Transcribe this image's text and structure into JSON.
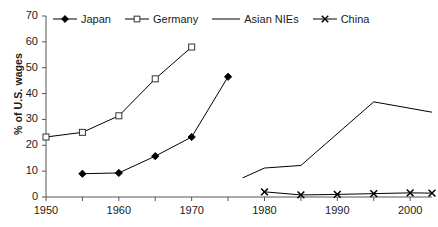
{
  "chart_data": {
    "type": "line",
    "title": "",
    "xlabel": "",
    "ylabel": "% of U.S. wages",
    "xlim": [
      1950,
      2003
    ],
    "ylim": [
      0,
      70
    ],
    "grid": false,
    "legend_position": "top",
    "xticks": [
      1950,
      1960,
      1970,
      1980,
      1990,
      2000
    ],
    "xtick_labels": [
      "1950",
      "1960",
      "1970",
      "1980",
      "1990",
      "2000"
    ],
    "xminor_ticks": [
      1955,
      1965,
      1975,
      1985,
      1995
    ],
    "yticks": [
      0,
      10,
      20,
      30,
      40,
      50,
      60,
      70
    ],
    "ytick_labels": [
      "0",
      "10",
      "20",
      "30",
      "40",
      "50",
      "60",
      "70"
    ],
    "series": [
      {
        "name": "Japan",
        "marker": "filled-diamond",
        "color": "#000000",
        "x": [
          1955,
          1960,
          1965,
          1970,
          1975
        ],
        "values": [
          9.0,
          9.3,
          15.8,
          23.2,
          46.5
        ]
      },
      {
        "name": "Germany",
        "marker": "open-square",
        "color": "#000000",
        "x": [
          1950,
          1955,
          1960,
          1965,
          1970
        ],
        "values": [
          23.2,
          25.0,
          31.4,
          45.7,
          58.0
        ]
      },
      {
        "name": "Asian NIEs",
        "marker": "none",
        "color": "#000000",
        "x": [
          1977,
          1980,
          1985,
          1995,
          2003
        ],
        "values": [
          7.4,
          11.2,
          12.2,
          36.8,
          32.8
        ]
      },
      {
        "name": "China",
        "marker": "x-cross",
        "color": "#000000",
        "x": [
          1980,
          1985,
          1990,
          1995,
          2000,
          2003
        ],
        "values": [
          2.0,
          0.8,
          1.0,
          1.3,
          1.6,
          1.5
        ]
      }
    ]
  },
  "legend": {
    "items": [
      {
        "label": "Japan",
        "key": "filled-diamond"
      },
      {
        "label": "Germany",
        "key": "open-square"
      },
      {
        "label": "Asian NIEs",
        "key": "plain-line"
      },
      {
        "label": "China",
        "key": "x-cross"
      }
    ]
  },
  "axes": {
    "y_title": "% of U.S. wages"
  }
}
